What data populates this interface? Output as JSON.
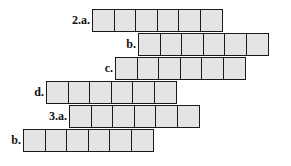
{
  "puzzle": {
    "rows": [
      {
        "label": "2.a.",
        "start_col": 4,
        "cells": 6
      },
      {
        "label": "b.",
        "start_col": 6,
        "cells": 6
      },
      {
        "label": "c.",
        "start_col": 5,
        "cells": 6
      },
      {
        "label": "d.",
        "start_col": 2,
        "cells": 6
      },
      {
        "label": "3.a.",
        "start_col": 3,
        "cells": 6
      },
      {
        "label": "b.",
        "start_col": 1,
        "cells": 6
      }
    ],
    "cell_fill": "#e4e4e4",
    "border_color": "#1a1a1a"
  }
}
